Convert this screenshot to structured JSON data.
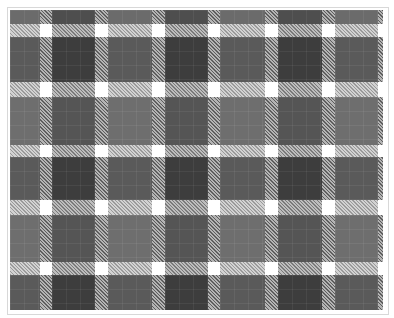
{
  "image": {
    "description": "Grayscale tartan/plaid pattern inside a thin light-gray frame",
    "width": 394,
    "height": 318
  },
  "header": {
    "clipped_text": ""
  },
  "pattern": {
    "type": "tartan",
    "columns": [
      {
        "kind": "A",
        "x0": 10,
        "x1": 40
      },
      {
        "kind": "hatch",
        "x0": 40,
        "x1": 52
      },
      {
        "kind": "B",
        "x0": 52,
        "x1": 95
      },
      {
        "kind": "hatch",
        "x0": 95,
        "x1": 108
      },
      {
        "kind": "A",
        "x0": 108,
        "x1": 152
      },
      {
        "kind": "hatch",
        "x0": 152,
        "x1": 165
      },
      {
        "kind": "B",
        "x0": 165,
        "x1": 208
      },
      {
        "kind": "hatch",
        "x0": 208,
        "x1": 220
      },
      {
        "kind": "A",
        "x0": 220,
        "x1": 265
      },
      {
        "kind": "hatch",
        "x0": 265,
        "x1": 278
      },
      {
        "kind": "B",
        "x0": 278,
        "x1": 322
      },
      {
        "kind": "hatch",
        "x0": 322,
        "x1": 335
      },
      {
        "kind": "A",
        "x0": 335,
        "x1": 378
      },
      {
        "kind": "hatch",
        "x0": 378,
        "x1": 383
      }
    ],
    "rows": [
      {
        "kind": "R1",
        "y0": 10,
        "y1": 24
      },
      {
        "kind": "hatch",
        "y0": 24,
        "y1": 37
      },
      {
        "kind": "R2",
        "y0": 37,
        "y1": 82
      },
      {
        "kind": "hatch",
        "y0": 82,
        "y1": 97
      },
      {
        "kind": "R3",
        "y0": 97,
        "y1": 145
      },
      {
        "kind": "hatch",
        "y0": 145,
        "y1": 157
      },
      {
        "kind": "R2",
        "y0": 157,
        "y1": 200
      },
      {
        "kind": "hatch",
        "y0": 200,
        "y1": 215
      },
      {
        "kind": "R3",
        "y0": 215,
        "y1": 262
      },
      {
        "kind": "hatch",
        "y0": 262,
        "y1": 275
      },
      {
        "kind": "R2",
        "y0": 275,
        "y1": 310
      }
    ],
    "colors": {
      "frame_border": "#d8d8d8",
      "background": "#ffffff",
      "block_dark": "#3d3d3d",
      "block_mid": "#5a5a5a",
      "block_light": "#6e6e6e",
      "hatch_light": "#d0d0d0",
      "hatch_dark": "#9a9a9a",
      "intersection": "#ffffff"
    }
  }
}
